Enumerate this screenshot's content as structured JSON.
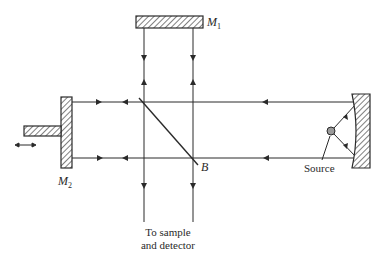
{
  "diagram": {
    "type": "Michelson interferometer schematic",
    "labels": {
      "m1": "M",
      "m1_sub": "1",
      "m2": "M",
      "m2_sub": "2",
      "beamsplitter": "B",
      "source": "Source",
      "output_line1": "To sample",
      "output_line2": "and detector"
    },
    "components": [
      {
        "id": "fixed-mirror",
        "label": "M1"
      },
      {
        "id": "movable-mirror",
        "label": "M2",
        "motion": "double-headed arrow (translation)"
      },
      {
        "id": "beamsplitter",
        "label": "B"
      },
      {
        "id": "collimating-mirror",
        "label": "curved mirror"
      },
      {
        "id": "light-source",
        "label": "Source"
      }
    ],
    "colors": {
      "line": "#2a2a2a",
      "background": "#ffffff"
    }
  }
}
